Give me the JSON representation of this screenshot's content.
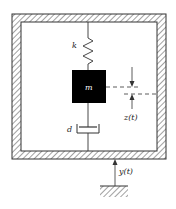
{
  "diagram": {
    "type": "mechanical-vibration-model",
    "labels": {
      "spring": "k",
      "mass": "m",
      "damper": "d",
      "relative_displacement": "z(t)",
      "base_displacement": "y(t)"
    },
    "colors": {
      "line": "#333333",
      "mass_fill": "#000000",
      "background": "#ffffff"
    }
  }
}
